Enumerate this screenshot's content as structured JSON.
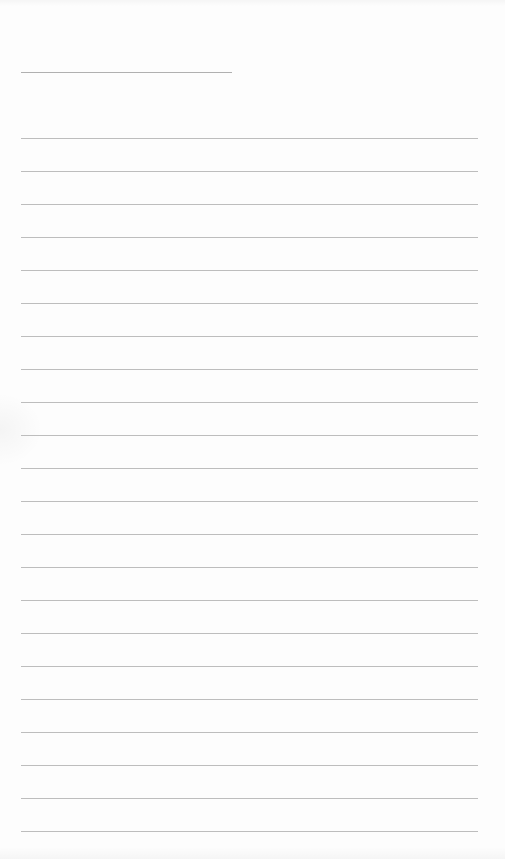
{
  "page": {
    "type": "lined-notepad-sheet",
    "background_color": "#fdfdfd",
    "line_color": "#bdbdbd",
    "title_line": {
      "x": 21,
      "y": 72,
      "width": 211
    },
    "rules": {
      "x": 21,
      "width": 457,
      "first_y": 138,
      "spacing": 33,
      "count": 22
    }
  }
}
